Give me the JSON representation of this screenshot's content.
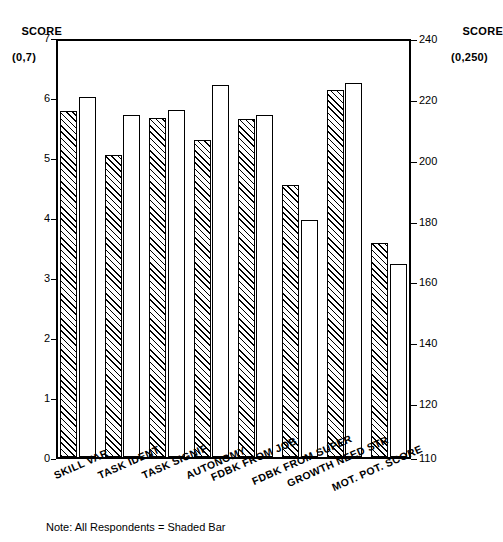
{
  "note": "Note:  All Respondents = Shaded Bar",
  "left_axis": {
    "title": "SCORE",
    "range_label": "(0,7)",
    "ticks": [
      "7",
      "6",
      "5",
      "4",
      "3",
      "2",
      "1",
      "0"
    ],
    "tick_values": [
      7,
      6,
      5,
      4,
      3,
      2,
      1,
      0
    ]
  },
  "right_axis": {
    "title": "SCORE",
    "range_label": "(0,250)",
    "ticks": [
      "240",
      "220",
      "200",
      "180",
      "160",
      "140",
      "120",
      "110"
    ],
    "tick_values": [
      240,
      220,
      200,
      180,
      160,
      140,
      120,
      110
    ]
  },
  "categories": [
    "SKILL VAR",
    "TASK IDENT",
    "TASK SIGNIF",
    "AUTONOMY",
    "FDBK FROM JOB",
    "FDBK FROM SUPER",
    "GROWTH NEED STR",
    "MOT. POT. SCORE"
  ],
  "chart_data": {
    "type": "bar",
    "title": "",
    "xlabel": "",
    "ylabel": "SCORE",
    "categories": [
      "SKILL VAR",
      "TASK IDENT",
      "TASK SIGNIF",
      "AUTONOMY",
      "FDBK FROM JOB",
      "FDBK FROM SUPER",
      "GROWTH NEED STR",
      "MOT. POT. SCORE"
    ],
    "series": [
      {
        "name": "All Respondents",
        "style": "shaded",
        "values": [
          5.78,
          5.05,
          5.67,
          5.3,
          5.65,
          4.55,
          6.14,
          173
        ],
        "axis": [
          "left",
          "left",
          "left",
          "left",
          "left",
          "left",
          "left",
          "right"
        ]
      },
      {
        "name": "Comparison Group",
        "style": "white",
        "values": [
          6.02,
          5.72,
          5.8,
          6.22,
          5.72,
          3.97,
          6.25,
          166
        ],
        "axis": [
          "left",
          "left",
          "left",
          "left",
          "left",
          "left",
          "left",
          "right"
        ]
      }
    ],
    "ylim": [
      0,
      7
    ],
    "y2lim": [
      110,
      240
    ],
    "ylim_label": "(0,7)",
    "y2lim_label": "(0,250)",
    "grid": false,
    "legend_position": "below-as-note",
    "legend_note": "Note:  All Respondents = Shaded Bar"
  }
}
